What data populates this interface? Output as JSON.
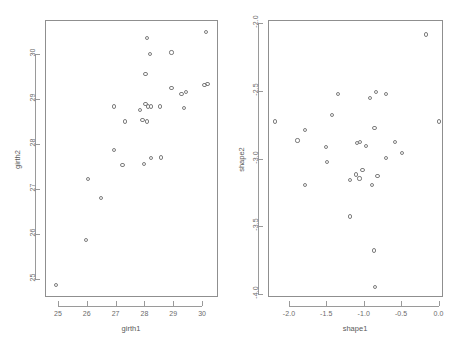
{
  "figure": {
    "background": "#ffffff",
    "point_color": "#7d7d7d",
    "axis_color": "#9a9a9a",
    "text_color": "#6b6b6b",
    "width": 460,
    "height": 347,
    "panels": 2
  },
  "chart_data": [
    {
      "type": "scatter",
      "title": "",
      "xlabel": "girth1",
      "ylabel": "girth2",
      "xlim": [
        24.55,
        30.55
      ],
      "ylim": [
        24.6,
        30.75
      ],
      "xticks": [
        25,
        26,
        27,
        28,
        29,
        30
      ],
      "xticklabels": [
        "25",
        "26",
        "27",
        "28",
        "29",
        "30"
      ],
      "yticks": [
        25,
        26,
        27,
        28,
        29,
        30
      ],
      "yticklabels": [
        "25",
        "26",
        "27",
        "28",
        "29",
        "30"
      ],
      "grid": false,
      "legend": null,
      "marker": "open-circle",
      "x": [
        24.9,
        25.95,
        26.0,
        26.45,
        26.9,
        26.9,
        27.2,
        27.3,
        27.8,
        27.9,
        27.95,
        28.0,
        28.0,
        28.05,
        28.05,
        28.1,
        28.15,
        28.2,
        28.2,
        28.5,
        28.55,
        28.9,
        28.9,
        29.25,
        29.35,
        29.4,
        30.05,
        30.1,
        30.15
      ],
      "y": [
        24.88,
        25.88,
        27.25,
        26.82,
        27.88,
        28.85,
        27.55,
        28.52,
        28.78,
        28.55,
        27.57,
        29.58,
        28.9,
        30.37,
        28.52,
        28.85,
        30.02,
        28.85,
        27.7,
        28.85,
        27.72,
        30.05,
        29.27,
        29.13,
        28.82,
        29.18,
        29.33,
        30.5,
        29.35
      ]
    },
    {
      "type": "scatter",
      "title": "",
      "xlabel": "shape1",
      "ylabel": "shape2",
      "xlim": [
        -2.28,
        0.06
      ],
      "ylim": [
        -4.02,
        -1.98
      ],
      "xticks": [
        -2.0,
        -1.5,
        -1.0,
        -0.5,
        0.0
      ],
      "xticklabels": [
        "-2.0",
        "-1.5",
        "-1.0",
        "-0.5",
        "0.0"
      ],
      "yticks": [
        -2.0,
        -2.5,
        -3.0,
        -3.5,
        -4.0
      ],
      "yticklabels": [
        "-2.0",
        "-2.5",
        "-3.0",
        "-3.5",
        "-4.0"
      ],
      "grid": false,
      "legend": null,
      "marker": "open-circle",
      "x": [
        -2.2,
        -1.9,
        -1.8,
        -1.8,
        -1.52,
        -1.5,
        -1.44,
        -1.36,
        -1.2,
        -1.2,
        -1.12,
        -1.1,
        -1.07,
        -1.06,
        -1.03,
        -0.98,
        -0.93,
        -0.9,
        -0.88,
        -0.87,
        -0.86,
        -0.85,
        -0.83,
        -0.72,
        -0.72,
        -0.6,
        -0.5,
        -0.18,
        -0.01
      ],
      "y": [
        -2.72,
        -2.86,
        -2.78,
        -3.19,
        -2.91,
        -3.02,
        -2.67,
        -2.52,
        -3.42,
        -3.15,
        -3.11,
        -2.88,
        -3.14,
        -2.87,
        -3.08,
        -2.9,
        -2.55,
        -3.19,
        -3.67,
        -2.77,
        -3.94,
        -2.5,
        -3.12,
        -2.99,
        -2.52,
        -2.87,
        -2.95,
        -2.08,
        -2.72
      ]
    }
  ]
}
